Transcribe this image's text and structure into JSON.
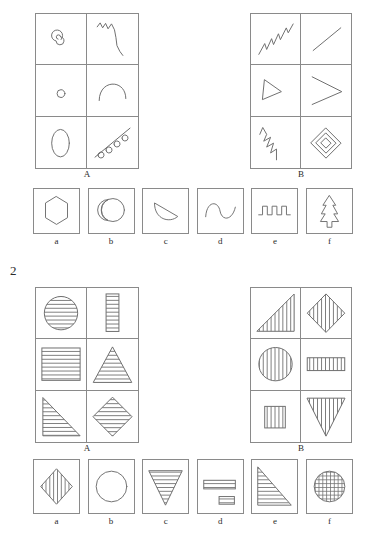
{
  "page": {
    "background": "#ffffff",
    "ink": "#6e6e6e",
    "text_color": "#2b2b2b",
    "width": 367,
    "height": 540
  },
  "problems": [
    {
      "number": "",
      "number_visible": false,
      "matrices": [
        {
          "label": "A",
          "cells": [
            {
              "position": "row1-col1",
              "shape": "spiral",
              "description": "small spiral curl"
            },
            {
              "position": "row1-col2",
              "shape": "zigzag-curve",
              "description": "wavy zigzag descending line"
            },
            {
              "position": "row2-col1",
              "shape": "small-circle",
              "description": "small open circle"
            },
            {
              "position": "row2-col2",
              "shape": "arch",
              "description": "inverted-U arc"
            },
            {
              "position": "row3-col1",
              "shape": "ellipse",
              "description": "tall vertical ellipse outline"
            },
            {
              "position": "row3-col2",
              "shape": "looped-line",
              "description": "diagonal line with four small loops"
            }
          ]
        },
        {
          "label": "B",
          "cells": [
            {
              "position": "row1-col1",
              "shape": "ascending-zigzag",
              "description": "rising jagged zigzag line"
            },
            {
              "position": "row1-col2",
              "shape": "diagonal-line",
              "description": "straight diagonal segment"
            },
            {
              "position": "row2-col1",
              "shape": "triangle-outline",
              "description": "small narrow triangle outline"
            },
            {
              "position": "row2-col2",
              "shape": "chevron",
              "description": "greater-than chevron angle"
            },
            {
              "position": "row3-col1",
              "shape": "descending-zigzag",
              "description": "descending sharp zigzag"
            },
            {
              "position": "row3-col2",
              "shape": "nested-diamond",
              "description": "nested concentric diamonds"
            }
          ]
        }
      ],
      "options": [
        {
          "label": "a",
          "shape": "hexagon",
          "description": "regular hexagon outline"
        },
        {
          "label": "b",
          "shape": "circle-with-arc",
          "description": "circle with inner arc on left"
        },
        {
          "label": "c",
          "shape": "half-disc",
          "description": "semicircular wedge outline"
        },
        {
          "label": "d",
          "shape": "sine-wave",
          "description": "S-shaped sine curve"
        },
        {
          "label": "e",
          "shape": "square-wave",
          "description": "square wave pulse train"
        },
        {
          "label": "f",
          "shape": "pine-tree",
          "description": "pine tree / arrow outline"
        }
      ]
    },
    {
      "number": "2",
      "number_visible": true,
      "matrices": [
        {
          "label": "A",
          "fill_pattern": "horizontal-lines",
          "cells": [
            {
              "position": "row1-col1",
              "shape": "circle",
              "fill": "horizontal-lines",
              "description": "circle with horizontal hatching"
            },
            {
              "position": "row1-col2",
              "shape": "tall-rectangle",
              "fill": "horizontal-lines",
              "description": "narrow tall rectangle with horizontal hatching"
            },
            {
              "position": "row2-col1",
              "shape": "square",
              "fill": "horizontal-lines",
              "description": "square with horizontal hatching"
            },
            {
              "position": "row2-col2",
              "shape": "triangle-up",
              "fill": "horizontal-lines",
              "description": "upward triangle with horizontal hatching"
            },
            {
              "position": "row3-col1",
              "shape": "right-triangle",
              "fill": "horizontal-lines",
              "description": "right triangle with horizontal hatching"
            },
            {
              "position": "row3-col2",
              "shape": "diamond",
              "fill": "horizontal-lines",
              "description": "diamond with horizontal hatching"
            }
          ]
        },
        {
          "label": "B",
          "fill_pattern": "vertical-lines",
          "cells": [
            {
              "position": "row1-col1",
              "shape": "right-triangle-mirror",
              "fill": "vertical-lines",
              "description": "right triangle with vertical hatching"
            },
            {
              "position": "row1-col2",
              "shape": "diamond",
              "fill": "vertical-lines",
              "description": "diamond with vertical hatching"
            },
            {
              "position": "row2-col1",
              "shape": "circle",
              "fill": "vertical-lines",
              "description": "circle with vertical hatching"
            },
            {
              "position": "row2-col2",
              "shape": "wide-rectangle",
              "fill": "vertical-lines",
              "description": "wide short rectangle with vertical hatching"
            },
            {
              "position": "row3-col1",
              "shape": "small-square",
              "fill": "vertical-lines",
              "description": "small square with vertical hatching"
            },
            {
              "position": "row3-col2",
              "shape": "triangle-down",
              "fill": "vertical-lines",
              "description": "downward triangle with vertical hatching"
            }
          ]
        }
      ],
      "options": [
        {
          "label": "a",
          "shape": "diamond",
          "fill": "vertical-lines",
          "description": "diamond with vertical hatching"
        },
        {
          "label": "b",
          "shape": "circle",
          "fill": "none",
          "description": "plain circle outline, no hatching"
        },
        {
          "label": "c",
          "shape": "triangle-down",
          "fill": "horizontal-lines",
          "description": "downward triangle with horizontal hatching"
        },
        {
          "label": "d",
          "shape": "two-rectangles",
          "fill": "horizontal-lines",
          "description": "two horizontally hatched rectangles"
        },
        {
          "label": "e",
          "shape": "right-triangle",
          "fill": "horizontal-lines",
          "description": "right triangle with horizontal hatching"
        },
        {
          "label": "f",
          "shape": "circle",
          "fill": "cross-hatch",
          "description": "circle with cross-hatch grid"
        }
      ]
    }
  ]
}
